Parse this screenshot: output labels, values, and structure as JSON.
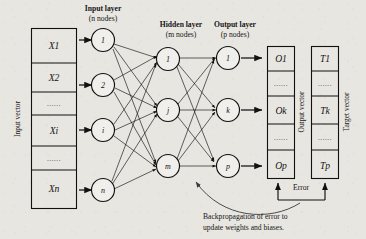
{
  "figure": {
    "type": "diagram"
  },
  "labels": {
    "input_layer_line1": "Input layer",
    "input_layer_line2": "(n nodes)",
    "hidden_layer_line1": "Hidden layer",
    "hidden_layer_line2": "(m nodes)",
    "output_layer_line1": "Output layer",
    "output_layer_line2": "(p nodes)",
    "input_vector": "Input vector",
    "output_vector": "Output vector",
    "target_vector": "Target vector",
    "error": "Error",
    "backprop_line1": "Backpropagation of error to",
    "backprop_line2": "update weights and biases.",
    "ellipsis": "......"
  },
  "input_vector_cells": [
    {
      "text": "X1",
      "kind": "value"
    },
    {
      "text": "X2",
      "kind": "value"
    },
    {
      "text": "......",
      "kind": "ellipsis"
    },
    {
      "text": "Xi",
      "kind": "value"
    },
    {
      "text": "......",
      "kind": "ellipsis"
    },
    {
      "text": "Xn",
      "kind": "value"
    }
  ],
  "output_vector_cells": [
    {
      "text": "O1",
      "kind": "value"
    },
    {
      "text": "......",
      "kind": "ellipsis"
    },
    {
      "text": "Ok",
      "kind": "value"
    },
    {
      "text": "......",
      "kind": "ellipsis"
    },
    {
      "text": "Op",
      "kind": "value"
    }
  ],
  "target_vector_cells": [
    {
      "text": "T1",
      "kind": "value"
    },
    {
      "text": "......",
      "kind": "ellipsis"
    },
    {
      "text": "Tk",
      "kind": "value"
    },
    {
      "text": "......",
      "kind": "ellipsis"
    },
    {
      "text": "Tp",
      "kind": "value"
    }
  ],
  "input_nodes": [
    {
      "label": "1"
    },
    {
      "label": "2"
    },
    {
      "label": "i"
    },
    {
      "label": "n"
    }
  ],
  "hidden_nodes": [
    {
      "label": "1"
    },
    {
      "label": "j"
    },
    {
      "label": "m"
    }
  ],
  "output_nodes": [
    {
      "label": "1"
    },
    {
      "label": "k"
    },
    {
      "label": "p"
    }
  ],
  "colors": {
    "background": "#e8e6e1",
    "ink": "#141414",
    "edge": "#111111",
    "backprop_arrow": "#3a3a3a"
  }
}
